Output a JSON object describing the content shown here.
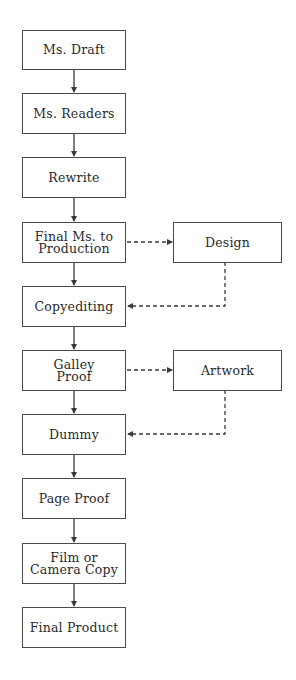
{
  "diagram": {
    "type": "flowchart",
    "colors": {
      "line": "#3a3a3a",
      "box_border": "#4a4a4a",
      "text": "#2a2a2a",
      "background": "#ffffff"
    },
    "main_steps": [
      {
        "id": "ms_draft",
        "label": "Ms. Draft"
      },
      {
        "id": "ms_readers",
        "label": "Ms. Readers"
      },
      {
        "id": "rewrite",
        "label": "Rewrite"
      },
      {
        "id": "final_ms",
        "label": "Final Ms. to\nProduction"
      },
      {
        "id": "copyediting",
        "label": "Copyediting"
      },
      {
        "id": "galley",
        "label": "Galley\nProof"
      },
      {
        "id": "dummy",
        "label": "Dummy"
      },
      {
        "id": "page_proof",
        "label": "Page Proof"
      },
      {
        "id": "film",
        "label": "Film or\nCamera Copy"
      },
      {
        "id": "final_product",
        "label": "Final Product"
      }
    ],
    "side_steps": [
      {
        "id": "design",
        "label": "Design"
      },
      {
        "id": "artwork",
        "label": "Artwork"
      }
    ],
    "edges": [
      {
        "from": "Ms. Draft",
        "to": "Ms. Readers",
        "style": "solid"
      },
      {
        "from": "Ms. Readers",
        "to": "Rewrite",
        "style": "solid"
      },
      {
        "from": "Rewrite",
        "to": "Final Ms. to Production",
        "style": "solid"
      },
      {
        "from": "Final Ms. to Production",
        "to": "Copyediting",
        "style": "solid"
      },
      {
        "from": "Copyediting",
        "to": "Galley Proof",
        "style": "solid"
      },
      {
        "from": "Galley Proof",
        "to": "Dummy",
        "style": "solid"
      },
      {
        "from": "Dummy",
        "to": "Page Proof",
        "style": "solid"
      },
      {
        "from": "Page Proof",
        "to": "Film or Camera Copy",
        "style": "solid"
      },
      {
        "from": "Film or Camera Copy",
        "to": "Final Product",
        "style": "solid"
      },
      {
        "from": "Final Ms. to Production",
        "to": "Design",
        "style": "dashed"
      },
      {
        "from": "Design",
        "to": "Copyediting",
        "style": "dashed"
      },
      {
        "from": "Galley Proof",
        "to": "Artwork",
        "style": "dashed"
      },
      {
        "from": "Artwork",
        "to": "Dummy",
        "style": "dashed"
      }
    ]
  }
}
